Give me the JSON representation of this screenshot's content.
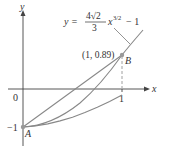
{
  "figure": {
    "axes": {
      "x_label": "x",
      "y_label": "y",
      "origin_label": "0",
      "x_tick_label": "1",
      "y_tick_label": "−1"
    },
    "equation": {
      "lhs": "y =",
      "numerator": "4√2",
      "denominator": "3",
      "x": "x",
      "exponent": "3/2",
      "tail": "− 1"
    },
    "points": [
      {
        "name": "A",
        "label": "A",
        "x": 0,
        "y": -1
      },
      {
        "name": "B",
        "label": "B",
        "x": 1,
        "y": 0.89,
        "coord_label": "(1, 0.89)"
      }
    ],
    "colors": {
      "curve": "#888888",
      "axis": "#444444",
      "text": "#333333"
    }
  }
}
